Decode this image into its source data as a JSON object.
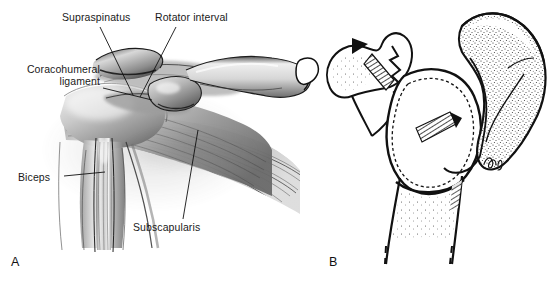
{
  "figure": {
    "background_color": "#ffffff",
    "ink_color": "#111111",
    "label_color": "#1a1a1a",
    "width": 553,
    "height": 283,
    "panels": [
      {
        "id": "A",
        "letter": "A",
        "style": "airbrush-grayscale-anatomical-rendering",
        "description": "Anterior view of the shoulder showing rotator cuff soft tissues"
      },
      {
        "id": "B",
        "letter": "B",
        "style": "stippled-line-drawing-schematic",
        "description": "Line drawing of scapula, glenoid, humeral head and proximal humerus with osteotomy"
      }
    ],
    "labels": [
      {
        "id": "supraspinatus",
        "text": "Supraspinatus",
        "x": 62,
        "y": 12,
        "align": "left",
        "leader": {
          "x1": 100,
          "y1": 27,
          "x2": 133,
          "y2": 95
        }
      },
      {
        "id": "rotator-interval",
        "text": "Rotator interval",
        "x": 155,
        "y": 12,
        "align": "left",
        "leader": {
          "x1": 176,
          "y1": 27,
          "x2": 140,
          "y2": 97
        }
      },
      {
        "id": "coracohumeral-ligament",
        "line1": "Coracohumeral",
        "line2": "ligament",
        "x": 8,
        "y": 64,
        "align": "right",
        "leader": {
          "x1": 103,
          "y1": 88,
          "x2": 152,
          "y2": 100
        }
      },
      {
        "id": "biceps",
        "text": "Biceps",
        "x": 18,
        "y": 172,
        "align": "left",
        "leader": {
          "x1": 64,
          "y1": 176,
          "x2": 105,
          "y2": 172
        }
      },
      {
        "id": "subscapularis",
        "text": "Subscapularis",
        "x": 133,
        "y": 222,
        "align": "left",
        "leader": {
          "x1": 183,
          "y1": 219,
          "x2": 198,
          "y2": 130
        }
      }
    ],
    "panel_letters": [
      {
        "id": "panel-a-letter",
        "text": "A",
        "x": 11,
        "y": 255
      },
      {
        "id": "panel-b-letter",
        "text": "B",
        "x": 329,
        "y": 255
      }
    ],
    "signature": {
      "id": "artist-signature",
      "x": 487,
      "y": 163
    }
  }
}
